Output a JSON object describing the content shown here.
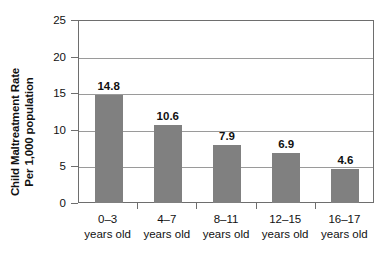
{
  "chart_data": {
    "type": "bar",
    "title": "",
    "subtitle": "",
    "xlabel": "",
    "ylabel": "Child Maltreatment Rate Per 1,000 population",
    "ylabel_lines": [
      "Child Maltreatment Rate",
      "Per 1,000 population"
    ],
    "categories": [
      "0–3 years old",
      "4–7 years old",
      "8–11 years old",
      "12–15 years old",
      "16–17 years old"
    ],
    "category_lines": [
      {
        "age": "0–3",
        "unit": "years old"
      },
      {
        "age": "4–7",
        "unit": "years old"
      },
      {
        "age": "8–11",
        "unit": "years old"
      },
      {
        "age": "12–15",
        "unit": "years old"
      },
      {
        "age": "16–17",
        "unit": "years old"
      }
    ],
    "values": [
      14.8,
      10.6,
      7.9,
      6.9,
      4.6
    ],
    "value_labels": [
      "14.8",
      "10.6",
      "7.9",
      "6.9",
      "4.6"
    ],
    "ylim": [
      0,
      25
    ],
    "ytick_values": [
      0,
      5,
      10,
      15,
      20,
      25
    ],
    "ytick_labels": [
      "0",
      "5",
      "10",
      "15",
      "20",
      "25"
    ],
    "grid": true,
    "grid_axis": "y",
    "legend": false,
    "legend_position": "none",
    "bar_color": "#808080",
    "axis_color": "#6e6e6e",
    "grid_color": "#9a9a9a",
    "text_color": "#111111",
    "background": "#ffffff"
  }
}
